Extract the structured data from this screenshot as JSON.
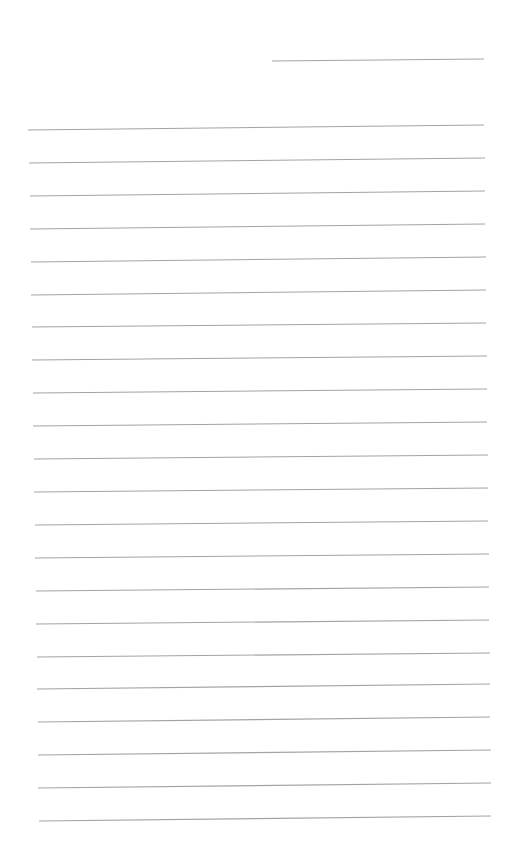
{
  "page": {
    "type": "lined-paper",
    "background": "#ffffff",
    "line_color": "#a3a3a3",
    "text": ""
  },
  "header_line": {
    "x1": 272,
    "y1": 61,
    "x2": 484,
    "y2": 59
  },
  "rules": [
    {
      "x1": 28,
      "y1": 130,
      "x2": 484,
      "y2": 125
    },
    {
      "x1": 29,
      "y1": 163,
      "x2": 485,
      "y2": 158
    },
    {
      "x1": 30,
      "y1": 196,
      "x2": 485,
      "y2": 191
    },
    {
      "x1": 30,
      "y1": 229,
      "x2": 485,
      "y2": 224
    },
    {
      "x1": 31,
      "y1": 262,
      "x2": 486,
      "y2": 257
    },
    {
      "x1": 31,
      "y1": 295,
      "x2": 486,
      "y2": 290
    },
    {
      "x1": 32,
      "y1": 327,
      "x2": 486,
      "y2": 323
    },
    {
      "x1": 32,
      "y1": 360,
      "x2": 487,
      "y2": 356
    },
    {
      "x1": 33,
      "y1": 393,
      "x2": 487,
      "y2": 389
    },
    {
      "x1": 33,
      "y1": 426,
      "x2": 487,
      "y2": 422
    },
    {
      "x1": 34,
      "y1": 459,
      "x2": 488,
      "y2": 455
    },
    {
      "x1": 34,
      "y1": 492,
      "x2": 488,
      "y2": 488
    },
    {
      "x1": 35,
      "y1": 525,
      "x2": 488,
      "y2": 521
    },
    {
      "x1": 35,
      "y1": 558,
      "x2": 489,
      "y2": 554
    },
    {
      "x1": 36,
      "y1": 591,
      "x2": 489,
      "y2": 587
    },
    {
      "x1": 36,
      "y1": 624,
      "x2": 489,
      "y2": 620
    },
    {
      "x1": 37,
      "y1": 657,
      "x2": 490,
      "y2": 653
    },
    {
      "x1": 37,
      "y1": 689,
      "x2": 490,
      "y2": 684
    },
    {
      "x1": 38,
      "y1": 722,
      "x2": 490,
      "y2": 717
    },
    {
      "x1": 38,
      "y1": 755,
      "x2": 491,
      "y2": 750
    },
    {
      "x1": 38,
      "y1": 788,
      "x2": 491,
      "y2": 783
    },
    {
      "x1": 39,
      "y1": 821,
      "x2": 491,
      "y2": 816
    }
  ]
}
